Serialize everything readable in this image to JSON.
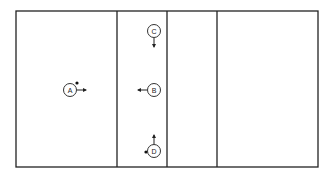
{
  "diagram": {
    "frame": {
      "x": 16,
      "y": 11,
      "width": 302,
      "height": 156
    },
    "dividers_x": [
      117,
      167,
      217
    ],
    "players": [
      {
        "label": "A",
        "cx": 70,
        "cy": 90,
        "arrow": "right",
        "dot": "upper-right"
      },
      {
        "label": "B",
        "cx": 154,
        "cy": 90,
        "arrow": "left",
        "dot": "none"
      },
      {
        "label": "C",
        "cx": 154,
        "cy": 31,
        "arrow": "down",
        "dot": "none"
      },
      {
        "label": "D",
        "cx": 154,
        "cy": 151,
        "arrow": "up",
        "dot": "left"
      }
    ],
    "colors": {
      "line": "#222222",
      "background": "#ffffff"
    }
  }
}
